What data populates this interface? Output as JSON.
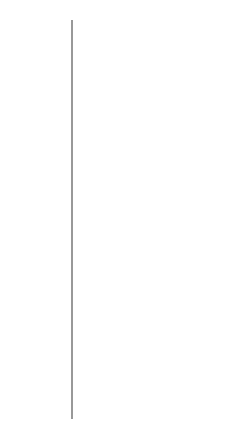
{
  "diagram": {
    "axis_label": "Resistivity/Ω m→",
    "ticks": [
      {
        "base": "10",
        "exp": "16"
      },
      {
        "base": "10",
        "exp": "15"
      },
      {
        "base": "10",
        "exp": "14"
      },
      {
        "base": "10",
        "exp": "13"
      },
      {
        "base": "10",
        "exp": "12"
      },
      {
        "base": "10",
        "exp": "11"
      },
      {
        "base": "10",
        "exp": "10"
      },
      {
        "base": "10",
        "exp": "9"
      },
      {
        "base": "10",
        "exp": "8"
      },
      {
        "base": "10",
        "exp": "7"
      },
      {
        "base": "10",
        "exp": "6"
      },
      {
        "base": "10",
        "exp": "5"
      },
      {
        "base": "10",
        "exp": "4"
      },
      {
        "base": "10",
        "exp": "3"
      },
      {
        "base": "10",
        "exp": "2"
      },
      {
        "base": "10",
        "exp": ""
      },
      {
        "base": "1",
        "exp": ""
      },
      {
        "base": "10",
        "exp": "-1"
      },
      {
        "base": "10",
        "exp": "-2"
      },
      {
        "base": "10",
        "exp": "-3"
      },
      {
        "base": "10",
        "exp": "-4"
      },
      {
        "base": "10",
        "exp": "-5"
      },
      {
        "base": "10",
        "exp": "-6"
      },
      {
        "base": "10",
        "exp": "-7"
      },
      {
        "base": "10",
        "exp": "-8"
      },
      {
        "base": "10",
        "exp": "-9"
      }
    ],
    "materials": [
      {
        "label": "Polystyrene",
        "exp": 15
      },
      {
        "label": "Sulphur",
        "exp": 13
      },
      {
        "label": "Diamond",
        "exp": 12
      },
      {
        "label": "Nickel oxide",
        "exp": 11
      },
      {
        "label": "Glass",
        "exp": 9
      },
      {
        "label": "Silver bromide",
        "exp": 6
      },
      {
        "label": "Silicon (pure)",
        "exp": 2.5
      },
      {
        "label": "Germanium (pure)",
        "exp": 0
      },
      {
        "label": "Germanium, doped",
        "exp": -2
      },
      {
        "label": "(transistor grade)",
        "exp": -3
      },
      {
        "label": "Bismuth, Titanium",
        "exp": -6
      },
      {
        "label": "Nickel, Iron, Tin",
        "exp": -7
      },
      {
        "label": "Copper, Silver",
        "exp": -8
      }
    ],
    "ranges": [
      {
        "label": "Insulator",
        "from_exp": 16,
        "to_exp": 6.5
      },
      {
        "label": "Semiconductor",
        "from_exp": 5.5,
        "to_exp": -2.8
      },
      {
        "label": "Conductor",
        "from_exp": -5,
        "to_exp": -9.3
      }
    ]
  }
}
